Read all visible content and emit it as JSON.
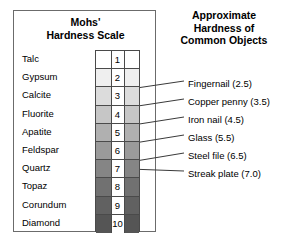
{
  "panels": {
    "mohs": {
      "title_line1": "Mohs'",
      "title_line2": "Hardness Scale"
    },
    "objects": {
      "title_line1": "Approximate",
      "title_line2": "Hardness of",
      "title_line3": "Common Objects"
    }
  },
  "chart_data": {
    "type": "table",
    "title": "Mohs' Hardness Scale",
    "xlabel": "",
    "ylabel": "Hardness",
    "categories": [
      "Talc",
      "Gypsum",
      "Calcite",
      "Fluorite",
      "Apatite",
      "Feldspar",
      "Quartz",
      "Topaz",
      "Corundum",
      "Diamond"
    ],
    "values": [
      1,
      2,
      3,
      4,
      5,
      6,
      7,
      8,
      9,
      10
    ],
    "rows": [
      {
        "mineral": "Talc",
        "number": "1",
        "shade": "#ffffff"
      },
      {
        "mineral": "Gypsum",
        "number": "2",
        "shade": "#efefef"
      },
      {
        "mineral": "Calcite",
        "number": "3",
        "shade": "#dcdcdc"
      },
      {
        "mineral": "Fluorite",
        "number": "4",
        "shade": "#c6c6c6"
      },
      {
        "mineral": "Apatite",
        "number": "5",
        "shade": "#b0b0b0"
      },
      {
        "mineral": "Feldspar",
        "number": "6",
        "shade": "#9a9a9a"
      },
      {
        "mineral": "Quartz",
        "number": "7",
        "shade": "#858585"
      },
      {
        "mineral": "Topaz",
        "number": "8",
        "shade": "#717171"
      },
      {
        "mineral": "Corundum",
        "number": "9",
        "shade": "#616161"
      },
      {
        "mineral": "Diamond",
        "number": "10",
        "shade": "#555555"
      }
    ],
    "annotations": [
      {
        "label": "Fingernail (2.5)",
        "hardness": 2.5,
        "label_x": 188,
        "label_y": 78,
        "line_x1": 140,
        "line_y1": 87.5,
        "line_x2": 184,
        "line_y2": 81
      },
      {
        "label": "Copper penny (3.5)",
        "hardness": 3.5,
        "label_x": 188,
        "label_y": 96,
        "line_x1": 140,
        "line_y1": 105.7,
        "line_x2": 184,
        "line_y2": 99
      },
      {
        "label": "Iron nail (4.5)",
        "hardness": 4.5,
        "label_x": 188,
        "label_y": 114,
        "line_x1": 140,
        "line_y1": 123.9,
        "line_x2": 184,
        "line_y2": 117
      },
      {
        "label": "Glass (5.5)",
        "hardness": 5.5,
        "label_x": 188,
        "label_y": 132,
        "line_x1": 140,
        "line_y1": 142.1,
        "line_x2": 184,
        "line_y2": 135
      },
      {
        "label": "Steel file (6.5)",
        "hardness": 6.5,
        "label_x": 188,
        "label_y": 150,
        "line_x1": 140,
        "line_y1": 160.3,
        "line_x2": 184,
        "line_y2": 153
      },
      {
        "label": "Streak plate (7.0)",
        "hardness": 7.0,
        "label_x": 188,
        "label_y": 168,
        "line_x1": 140,
        "line_y1": 169.4,
        "line_x2": 184,
        "line_y2": 171
      }
    ],
    "grid": false,
    "legend": "none"
  },
  "colors": {
    "panel_border": "#6b6b6b",
    "grid_border": "#4a4a4a",
    "leader_line": "#3a3a3a",
    "text": "#000000",
    "background": "#ffffff"
  }
}
